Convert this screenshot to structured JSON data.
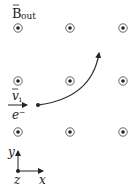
{
  "diagram": {
    "field_label": {
      "main": "B",
      "sub": "out"
    },
    "velocity_label": {
      "main": "v",
      "sub": "i"
    },
    "particle_label": "e⁻",
    "axes": {
      "y": "y",
      "x": "x",
      "z": "z"
    },
    "field_dots": [
      {
        "x": 18,
        "y": 28
      },
      {
        "x": 70,
        "y": 28
      },
      {
        "x": 123,
        "y": 28
      },
      {
        "x": 18,
        "y": 81
      },
      {
        "x": 70,
        "y": 81
      },
      {
        "x": 123,
        "y": 81
      },
      {
        "x": 18,
        "y": 132
      },
      {
        "x": 70,
        "y": 132
      },
      {
        "x": 123,
        "y": 132
      }
    ],
    "colors": {
      "ink": "#222222",
      "dot_ring": "#555555"
    }
  }
}
